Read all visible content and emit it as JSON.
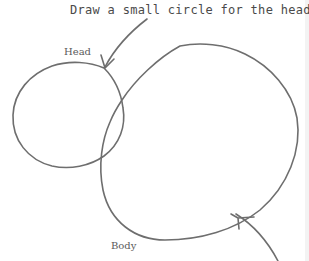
{
  "figure": {
    "instruction": "Draw a small circle for the head.",
    "labels": {
      "head": "Head",
      "body": "Body"
    },
    "shapes": {
      "head_circle": {
        "cx": 68,
        "cy": 115,
        "rx": 55,
        "ry": 52
      },
      "body_oval": {
        "approx_bounds": {
          "left": 101,
          "top": 45,
          "right": 298,
          "bottom": 240
        }
      }
    },
    "arrows": [
      {
        "name": "head-arrow",
        "from": [
          147,
          19
        ],
        "to": [
          105,
          68
        ]
      },
      {
        "name": "body-arrow",
        "from": [
          275,
          261
        ],
        "to": [
          237,
          216
        ]
      }
    ],
    "colors": {
      "stroke": "#6e6e6e",
      "text": "#4a4a4a",
      "background": "#ffffff"
    }
  }
}
